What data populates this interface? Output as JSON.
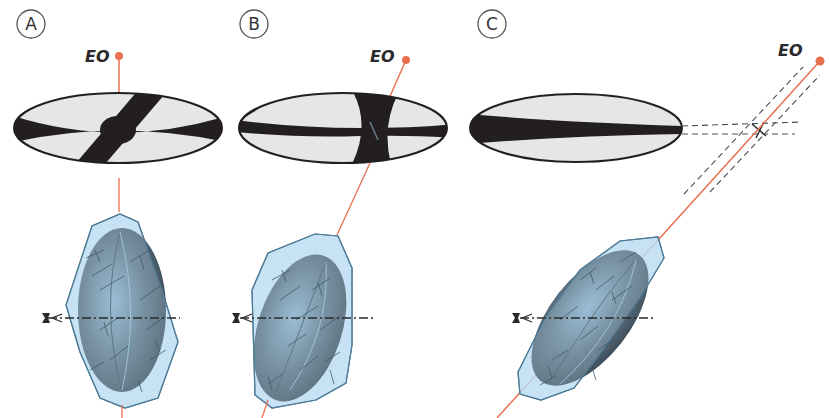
{
  "diagram": {
    "colors": {
      "optic_axis": "#e8704f",
      "figure_dark": "#231f20",
      "figure_light": "#e4e6e8",
      "crystal_fill": "#b9dcf2",
      "crystal_edge": "#4d7a96",
      "indicatrix": "#5f7784",
      "dashed": "#44505a"
    },
    "panels": [
      {
        "id": "A",
        "label": "A",
        "axis_label": "EO",
        "figure": "centered optic-axis cross (isogyres crossing at center)",
        "axis_orientation": "vertical"
      },
      {
        "id": "B",
        "label": "B",
        "axis_label": "EO",
        "figure": "off-center cross, slightly inclined optic axis",
        "axis_orientation": "inclined"
      },
      {
        "id": "C",
        "label": "C",
        "axis_label": "EO",
        "figure": "single isogyre bar; melatope outside field of view",
        "axis_orientation": "strongly inclined"
      }
    ]
  }
}
